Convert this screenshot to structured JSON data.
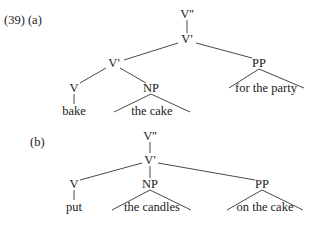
{
  "example_number": "(39)",
  "trees": [
    {
      "label": "(a)",
      "nodes": {
        "vbar2": "V''",
        "vbar_top": "V'",
        "vbar_inner": "V'",
        "v": "V",
        "np": "NP",
        "pp": "PP",
        "v_word": "bake",
        "np_words": "the cake",
        "pp_words": "for the party"
      }
    },
    {
      "label": "(b)",
      "nodes": {
        "vbar2": "V''",
        "vbar": "V'",
        "v": "V",
        "np": "NP",
        "pp": "PP",
        "v_word": "put",
        "np_words": "the candles",
        "pp_words": "on the cake"
      }
    }
  ]
}
